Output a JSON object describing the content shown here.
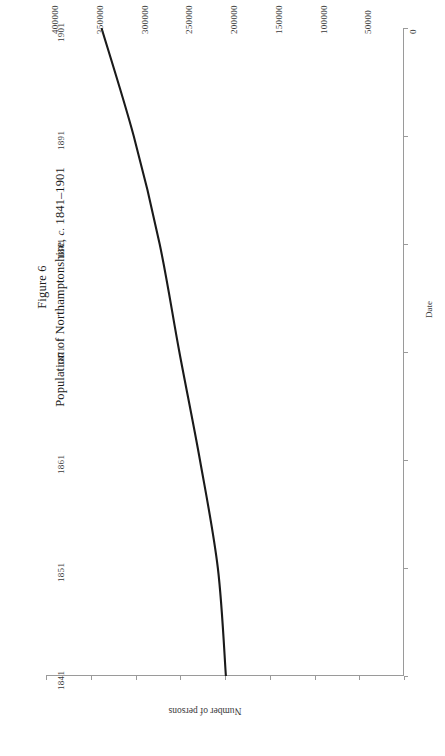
{
  "figure": {
    "number_label": "Figure 6",
    "caption_main_before": "Population of Northamptonshire, ",
    "caption_italic": "c.",
    "caption_main_after": " 1841–1901"
  },
  "axes": {
    "value_axis_title": "Number of persons",
    "date_axis_title": "Date",
    "value_ticks": [
      "400000",
      "350000",
      "300000",
      "250000",
      "200000",
      "150000",
      "100000",
      "50000",
      "0"
    ],
    "date_ticks": [
      "1841",
      "1851",
      "1861",
      "1871",
      "1881",
      "1891",
      "1901"
    ]
  },
  "style": {
    "line_color": "#1a1a1a",
    "axis_color": "#9a9a9a",
    "text_color": "#3a3a3a"
  },
  "chart_data": {
    "type": "line",
    "title": "Population of Northamptonshire, c. 1841–1901",
    "orientation": "rotated-90-counterclockwise",
    "xlabel": "Date",
    "ylabel": "Number of persons",
    "x": [
      1841,
      1851,
      1861,
      1871,
      1881,
      1891,
      1901
    ],
    "values": [
      199000,
      208000,
      228000,
      251000,
      273000,
      302000,
      338000
    ],
    "xlim": [
      1841,
      1901
    ],
    "ylim": [
      0,
      400000
    ],
    "ytick_values": [
      0,
      50000,
      100000,
      150000,
      200000,
      250000,
      300000,
      350000,
      400000
    ],
    "grid": false,
    "legend": null,
    "series": [
      {
        "name": "Population of Northamptonshire",
        "values": [
          199000,
          208000,
          228000,
          251000,
          273000,
          302000,
          338000
        ]
      }
    ]
  }
}
